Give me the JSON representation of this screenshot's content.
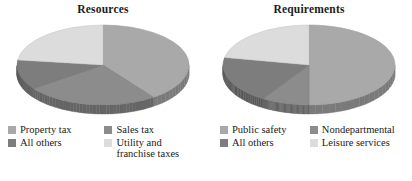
{
  "charts": [
    {
      "title": "Resources",
      "legend": [
        {
          "label": "Property tax",
          "color": "#a9a9a9",
          "value": 40
        },
        {
          "label": "Sales tax",
          "color": "#8c8c8c",
          "value": 25
        },
        {
          "label": "All others",
          "color": "#7d7d7d",
          "value": 12
        },
        {
          "label": "Utility and\nfranchise taxes",
          "color": "#dcdcdc",
          "value": 23
        }
      ]
    },
    {
      "title": "Requirements",
      "legend": [
        {
          "label": "Public safety",
          "color": "#a9a9a9",
          "value": 50
        },
        {
          "label": "Nondepartmental",
          "color": "#8c8c8c",
          "value": 9
        },
        {
          "label": "All others",
          "color": "#7d7d7d",
          "value": 19
        },
        {
          "label": "Leisure services",
          "color": "#dcdcdc",
          "value": 22
        }
      ]
    }
  ],
  "chart_data": [
    {
      "type": "pie",
      "title": "Resources",
      "labels": [
        "Property tax",
        "Sales tax",
        "All others",
        "Utility and franchise taxes"
      ],
      "values": [
        40,
        25,
        12,
        23
      ],
      "colors": [
        "#a9a9a9",
        "#8c8c8c",
        "#7d7d7d",
        "#dcdcdc"
      ],
      "legend_position": "bottom",
      "three_d": true,
      "start_angle_deg": -90,
      "direction": "clockwise",
      "xlabel": "",
      "ylabel": ""
    },
    {
      "type": "pie",
      "title": "Requirements",
      "labels": [
        "Public safety",
        "Nondepartmental",
        "All others",
        "Leisure services"
      ],
      "values": [
        50,
        9,
        19,
        22
      ],
      "colors": [
        "#a9a9a9",
        "#8c8c8c",
        "#7d7d7d",
        "#dcdcdc"
      ],
      "legend_position": "bottom",
      "three_d": true,
      "start_angle_deg": -90,
      "direction": "clockwise",
      "xlabel": "",
      "ylabel": ""
    }
  ],
  "palette": {
    "background": "#ffffff",
    "text": "#1a1a1a",
    "slice_medium": "#a9a9a9",
    "slice_dark": "#8c8c8c",
    "slice_darker": "#7d7d7d",
    "slice_light": "#dcdcdc",
    "side_shadow": "#6e6e6e"
  }
}
